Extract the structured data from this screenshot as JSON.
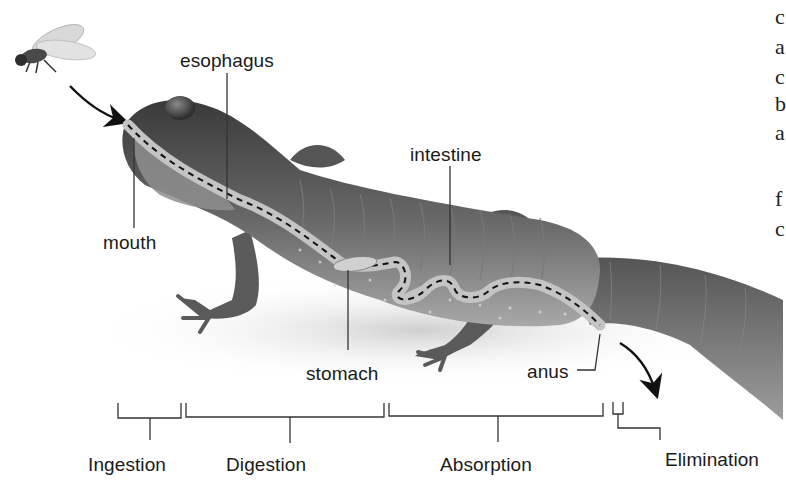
{
  "diagram": {
    "anatomy_labels": [
      {
        "id": "esophagus",
        "text": "esophagus"
      },
      {
        "id": "mouth",
        "text": "mouth"
      },
      {
        "id": "intestine",
        "text": "intestine"
      },
      {
        "id": "stomach",
        "text": "stomach"
      },
      {
        "id": "anus",
        "text": "anus"
      }
    ],
    "stages": [
      {
        "id": "ingestion",
        "text": "Ingestion"
      },
      {
        "id": "digestion",
        "text": "Digestion"
      },
      {
        "id": "absorption",
        "text": "Absorption"
      },
      {
        "id": "elimination",
        "text": "Elimination"
      }
    ],
    "cropped_side_text": [
      "c",
      "a",
      "c",
      "b",
      "a",
      "f",
      "c"
    ],
    "colors": {
      "background": "#ffffff",
      "label_text": "#1a1a1a",
      "leader_line": "#333333",
      "body_dark": "#4a4a4a",
      "body_light": "#9a9a9a",
      "gut_fill": "#b8b8b8"
    }
  }
}
